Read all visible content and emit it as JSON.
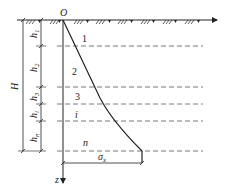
{
  "diagram": {
    "origin_label": "O",
    "depth_axis_label": "z",
    "total_depth_label": "H",
    "stress_label": "σ",
    "stress_subscript": "x",
    "layer_thickness_labels": [
      {
        "base": "h",
        "sub": "1"
      },
      {
        "base": "h",
        "sub": "2"
      },
      {
        "base": "h",
        "sub": "3"
      },
      {
        "base": "h",
        "sub": "i"
      },
      {
        "base": "h",
        "sub": "n"
      }
    ],
    "layer_labels": [
      "1",
      "2",
      "3",
      "i",
      "n"
    ],
    "colors": {
      "line": "#222222",
      "dashed": "#555555",
      "background": "#ffffff"
    }
  }
}
